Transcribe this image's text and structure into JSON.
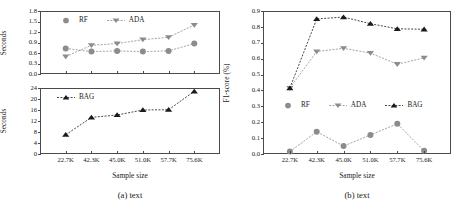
{
  "figure": {
    "subfigures": [
      {
        "caption": "(a) text"
      },
      {
        "caption": "(b) text"
      }
    ]
  },
  "series_names": {
    "rf": "RF",
    "ada": "ADA",
    "bag": "BAG"
  },
  "colors": {
    "rf": "#8c8c8c",
    "ada": "#8c8c8c",
    "bag": "#1a1a1a",
    "axis": "#4a4a4a",
    "grid_line": "#b0b0b0"
  },
  "chart_data": [
    {
      "type": "line",
      "title": "(a) text",
      "panel": "top-left",
      "xlabel": "Sample size",
      "ylabel": "Seconds",
      "categories": [
        "22.7K",
        "42.3K",
        "45.0K",
        "51.0K",
        "57.7K",
        "75.6K"
      ],
      "ylim": [
        0.0,
        1.8
      ],
      "yticks": [
        "1.8",
        "1.5",
        "1.2",
        "0.9",
        "0.6",
        "0.3",
        "0.0"
      ],
      "grid": false,
      "legend": [
        "RF",
        "ADA"
      ],
      "legend_position": "upper-left-inside",
      "series": [
        {
          "name": "RF",
          "marker": "circle",
          "values": [
            0.73,
            0.64,
            0.66,
            0.64,
            0.66,
            0.87
          ]
        },
        {
          "name": "ADA",
          "marker": "triangle-down",
          "values": [
            0.5,
            0.82,
            0.87,
            0.98,
            1.05,
            1.4
          ]
        }
      ]
    },
    {
      "type": "line",
      "title": "(a) text",
      "panel": "bottom-left",
      "xlabel": "Sample size",
      "ylabel": "Seconds",
      "categories": [
        "22.7K",
        "42.3K",
        "45.0K",
        "51.0K",
        "57.7K",
        "75.6K"
      ],
      "ylim": [
        0,
        24
      ],
      "yticks": [
        "24",
        "20",
        "16",
        "12",
        "8",
        "4",
        "0"
      ],
      "grid": false,
      "legend": [
        "BAG"
      ],
      "legend_position": "upper-left-inside",
      "series": [
        {
          "name": "BAG",
          "marker": "triangle-up",
          "values": [
            7.0,
            13.3,
            14.2,
            16.0,
            16.1,
            22.8
          ]
        }
      ]
    },
    {
      "type": "line",
      "title": "(b) text",
      "panel": "right",
      "xlabel": "Sample size",
      "ylabel": "F1-score (%)",
      "categories": [
        "22.7K",
        "42.3K",
        "45.0K",
        "51.0K",
        "57.7K",
        "75.6K"
      ],
      "ylim": [
        0.0,
        0.9
      ],
      "yticks": [
        "0.9",
        "0.8",
        "0.7",
        "0.6",
        "0.5",
        "0.4",
        "0.3",
        "0.2",
        "0.1",
        "0.0"
      ],
      "grid": false,
      "legend": [
        "RF",
        "ADA",
        "BAG"
      ],
      "legend_position": "lower-center-inside",
      "series": [
        {
          "name": "RF",
          "marker": "circle",
          "values": [
            0.015,
            0.14,
            0.05,
            0.12,
            0.19,
            0.02
          ]
        },
        {
          "name": "ADA",
          "marker": "triangle-down",
          "values": [
            0.415,
            0.645,
            0.665,
            0.635,
            0.565,
            0.605
          ]
        },
        {
          "name": "BAG",
          "marker": "triangle-up",
          "values": [
            0.415,
            0.85,
            0.862,
            0.82,
            0.788,
            0.785
          ]
        }
      ]
    }
  ]
}
